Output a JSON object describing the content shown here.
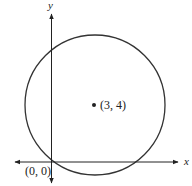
{
  "diagram": {
    "type": "circle-on-axes",
    "axes": {
      "x_label": "x",
      "y_label": "y"
    },
    "origin_label": "(0, 0)",
    "center": {
      "x": 3,
      "y": 4,
      "label": "(3, 4)"
    },
    "radius": 5,
    "colors": {
      "stroke": "#333333",
      "background": "#ffffff"
    }
  }
}
